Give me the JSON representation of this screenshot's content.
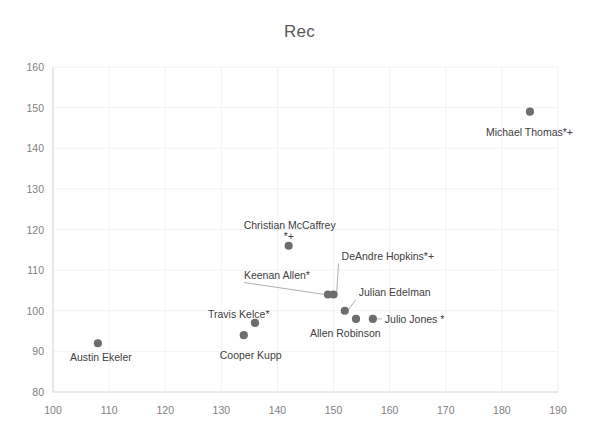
{
  "chart": {
    "title": "Rec",
    "xlabel": "",
    "ylabel": ""
  },
  "chart_data": {
    "type": "scatter",
    "title": "Rec",
    "xlabel": "",
    "ylabel": "",
    "xlim": [
      100,
      190
    ],
    "ylim": [
      80,
      160
    ],
    "xticks": [
      100,
      110,
      120,
      130,
      140,
      150,
      160,
      170,
      180,
      190
    ],
    "yticks": [
      80,
      90,
      100,
      110,
      120,
      130,
      140,
      150,
      160
    ],
    "grid": true,
    "legend": "none",
    "marker_color": "#6d6d6d",
    "points": [
      {
        "label": "Austin Ekeler",
        "x": 108,
        "y": 92,
        "label_dx": -28,
        "label_dy": 18,
        "leader": false
      },
      {
        "label": "Cooper Kupp",
        "x": 134,
        "y": 94,
        "label_dx": -24,
        "label_dy": 24,
        "leader": false
      },
      {
        "label": "Travis Kelce*",
        "x": 136,
        "y": 97,
        "label_dx": -47,
        "label_dy": -5,
        "leader": false
      },
      {
        "label": "Christian McCaffrey",
        "x": 142,
        "y": 116,
        "label_dx": -45,
        "label_dy": -17,
        "leader": false
      },
      {
        "label": "Keenan Allen*",
        "x": 149,
        "y": 104,
        "label_dx": -84,
        "label_dy": -16,
        "leader": true
      },
      {
        "label": "DeAndre Hopkins*+",
        "x": 150,
        "y": 104,
        "label_dx": 8,
        "label_dy": -35,
        "leader": true
      },
      {
        "label": "Julian Edelman",
        "x": 152,
        "y": 100,
        "label_dx": 14,
        "label_dy": -15,
        "leader": true
      },
      {
        "label": "Allen Robinson",
        "x": 154,
        "y": 98,
        "label_dx": -46,
        "label_dy": 18,
        "leader": false
      },
      {
        "label": "Julio Jones *",
        "x": 157,
        "y": 98,
        "label_dx": 12,
        "label_dy": 4,
        "leader": true
      },
      {
        "label": "Michael Thomas*+",
        "x": 185,
        "y": 149,
        "label_dx": -44,
        "label_dy": 24,
        "leader": false
      }
    ]
  }
}
